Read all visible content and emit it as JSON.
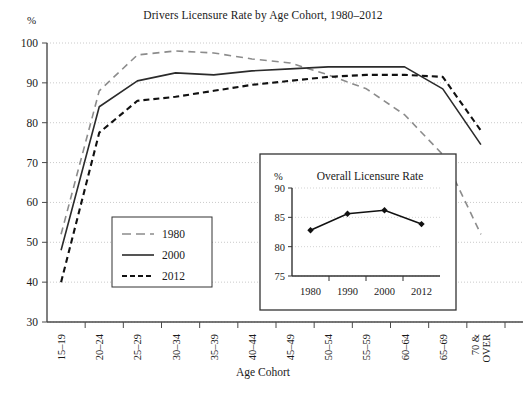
{
  "figure": {
    "title": "Drivers Licensure Rate by Age Cohort, 1980–2012",
    "y_unit": "%",
    "x_title": "Age Cohort"
  },
  "legend": {
    "position": "inside-lower-left",
    "items": [
      {
        "label": "1980",
        "style": "gray-dashed",
        "color": "#8c8c8c"
      },
      {
        "label": "2000",
        "style": "solid",
        "color": "#2b2b2b"
      },
      {
        "label": "2012",
        "style": "black-dashed",
        "color": "#111111"
      }
    ]
  },
  "axis": {
    "y_ticks": [
      "30",
      "40",
      "50",
      "60",
      "70",
      "80",
      "90",
      "100"
    ],
    "x_ticks": [
      "15–19",
      "20–24",
      "25–29",
      "30–34",
      "35–39",
      "40–44",
      "45–49",
      "50–54",
      "55–59",
      "60–64",
      "65–69",
      "70 &",
      "OVER"
    ]
  },
  "inset": {
    "title": "Overall Licensure Rate",
    "y_unit": "%",
    "y_ticks": [
      "75",
      "80",
      "85",
      "90"
    ],
    "x_ticks": [
      "1980",
      "1990",
      "2000",
      "2012"
    ]
  },
  "chart_data": {
    "type": "line",
    "title": "Drivers Licensure Rate by Age Cohort, 1980–2012",
    "xlabel": "Age Cohort",
    "ylabel": "%",
    "ylim": [
      30,
      100
    ],
    "grid": true,
    "legend_position": "inside lower-left",
    "categories": [
      "15–19",
      "20–24",
      "25–29",
      "30–34",
      "35–39",
      "40–44",
      "45–49",
      "50–54",
      "55–59",
      "60–64",
      "65–69",
      "70 & OVER"
    ],
    "series": [
      {
        "name": "1980",
        "style": "dashed",
        "color": "#8c8c8c",
        "values": [
          52.0,
          88.0,
          97.0,
          98.0,
          97.5,
          96.0,
          95.0,
          92.0,
          88.5,
          82.0,
          72.0,
          52.0
        ]
      },
      {
        "name": "2000",
        "style": "solid",
        "color": "#2b2b2b",
        "values": [
          48.0,
          84.0,
          90.5,
          92.5,
          92.0,
          93.0,
          93.5,
          94.0,
          94.0,
          94.0,
          88.5,
          74.5
        ]
      },
      {
        "name": "2012",
        "style": "dashed",
        "color": "#111111",
        "values": [
          40.0,
          77.5,
          85.5,
          86.5,
          88.0,
          89.5,
          90.5,
          91.5,
          92.0,
          92.0,
          91.5,
          78.0
        ]
      }
    ],
    "inset_chart": {
      "type": "line",
      "title": "Overall Licensure Rate",
      "ylabel": "%",
      "ylim": [
        75,
        90
      ],
      "grid": true,
      "markers": true,
      "categories": [
        "1980",
        "1990",
        "2000",
        "2012"
      ],
      "values": [
        82.8,
        85.6,
        86.2,
        83.85
      ]
    }
  }
}
